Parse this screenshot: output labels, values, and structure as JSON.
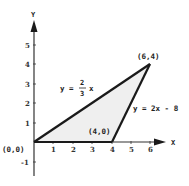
{
  "diagram": {
    "type": "coordinate-plane-triangle",
    "axes": {
      "x_label": "X",
      "y_label": "Y",
      "x_ticks": [
        "1",
        "2",
        "3",
        "4",
        "5",
        "6"
      ],
      "y_ticks": [
        "5",
        "4",
        "3",
        "2",
        "1",
        "-1"
      ]
    },
    "vertices": [
      {
        "label": "(0,0)",
        "x": 0,
        "y": 0
      },
      {
        "label": "(4,0)",
        "x": 4,
        "y": 0
      },
      {
        "label": "(6,4)",
        "x": 6,
        "y": 4
      }
    ],
    "lines": [
      {
        "label_lhs": "y =",
        "label_num": "2",
        "label_den": "3",
        "label_rhs": "x",
        "equation": "y = 2/3 x"
      },
      {
        "label": "y = 2x - 8",
        "equation": "y = 2x - 8"
      }
    ],
    "colors": {
      "stroke": "#1a1a1a",
      "fill": "#efefef"
    }
  }
}
